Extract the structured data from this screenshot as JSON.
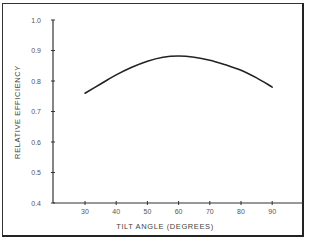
{
  "chart_data": {
    "type": "line",
    "title": "",
    "xlabel": "TILT ANGLE (DEGREES)",
    "ylabel": "RELATIVE EFFICIENCY",
    "xlim": [
      20,
      100
    ],
    "ylim": [
      0.4,
      1.0
    ],
    "x_ticks": [
      30,
      40,
      50,
      60,
      70,
      80,
      90
    ],
    "y_ticks": [
      "0.4",
      "0.5",
      "0.6",
      "0.7",
      "0.8",
      "0.9",
      "1.0"
    ],
    "grid": false,
    "legend": null,
    "series": [
      {
        "name": "Relative efficiency",
        "x": [
          30,
          35,
          40,
          45,
          50,
          55,
          60,
          65,
          70,
          75,
          80,
          85,
          90
        ],
        "values": [
          0.76,
          0.79,
          0.82,
          0.845,
          0.865,
          0.878,
          0.882,
          0.878,
          0.868,
          0.853,
          0.835,
          0.81,
          0.78
        ]
      }
    ]
  },
  "labels": {
    "xlabel": "TILT ANGLE (DEGREES)",
    "ylabel": "RELATIVE EFFICIENCY",
    "y_ticks": [
      "0.4",
      "0.5",
      "0.6",
      "0.7",
      "0.8",
      "0.9",
      "1.0"
    ],
    "x_ticks": [
      "30",
      "40",
      "50",
      "60",
      "70",
      "80",
      "90"
    ]
  },
  "colors": {
    "line": "#222222",
    "axis": "#333333",
    "text": "#555555"
  }
}
